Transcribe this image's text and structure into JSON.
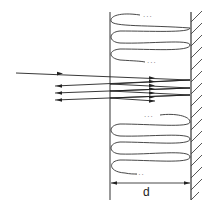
{
  "diagram": {
    "type": "optical cavity / multiple reflection schematic",
    "dimension_label": "d",
    "ellipsis": "...",
    "colors": {
      "stroke": "#222222",
      "background": "#ffffff"
    },
    "elements": [
      "incident ray entering from left",
      "three reflected rays exiting to left",
      "left boundary line",
      "right mirror wall with hatching",
      "coiled wave paths above and below ray bundle",
      "dimension arrow labeled d"
    ]
  }
}
